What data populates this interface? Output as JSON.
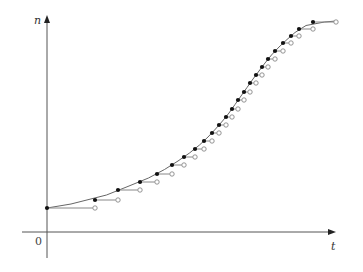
{
  "chart_data": {
    "type": "line",
    "title": "",
    "xlabel": "t",
    "ylabel": "n",
    "origin_label": "0",
    "grid": false,
    "legend": null,
    "xlim": [
      -25,
      290
    ],
    "ylim": [
      -26,
      217
    ],
    "curve": {
      "name": "n(t) smooth curve",
      "kind": "logistic",
      "n0": 24,
      "K": 212,
      "t_mid": 194,
      "steepness": 0.028,
      "t_end": 289
    },
    "steps": {
      "name": "step approximation",
      "t_left": [
        0,
        48,
        71,
        93,
        110,
        125,
        137,
        148,
        157,
        165,
        172,
        179,
        185,
        191,
        197,
        203,
        209,
        215,
        221,
        228,
        236,
        244,
        252,
        266
      ],
      "t_right": [
        48,
        71,
        93,
        110,
        125,
        137,
        148,
        157,
        165,
        172,
        179,
        185,
        191,
        197,
        203,
        209,
        215,
        221,
        228,
        236,
        244,
        252,
        266,
        289
      ],
      "n": [
        24,
        32,
        42,
        50,
        58,
        67,
        75,
        83,
        91,
        99,
        107,
        115,
        123,
        132,
        140,
        149,
        157,
        165,
        173,
        181,
        189,
        196,
        203,
        210
      ]
    },
    "colors": {
      "axis": "#555555",
      "curve": "#666666",
      "step_segment": "#888888",
      "filled_dot": "#111111",
      "open_circle": "#888888"
    }
  }
}
